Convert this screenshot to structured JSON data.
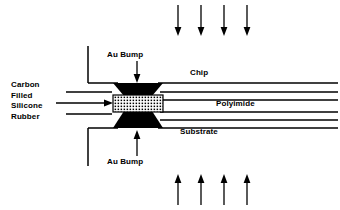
{
  "figure": {
    "background_color": "#ffffff",
    "line_color": "#000000",
    "fill_color": "#000000"
  },
  "labels": {
    "carbon_filled_silicone_rubber": "Carbon\nFilled\nSilicone\nRubber",
    "carbon_line_1": "Carbon",
    "carbon_line_2": "Filled",
    "carbon_line_3": "Silicone",
    "carbon_line_4": "Rubber",
    "au_bump_top": "Au Bump",
    "au_bump_bottom": "Au Bump",
    "chip": "Chip",
    "polyimide": "Polyimide",
    "substrate": "Substrate"
  },
  "force_arrows": {
    "top": {
      "count": 4,
      "direction": "down",
      "x_positions": [
        178,
        201,
        224,
        247
      ],
      "y_start": 5,
      "y_end": 35
    },
    "bottom": {
      "count": 4,
      "direction": "up",
      "x_positions": [
        178,
        201,
        224,
        247
      ],
      "y_start": 205,
      "y_end": 175
    }
  },
  "pointer_arrows": {
    "au_bump_top": {
      "direction": "down",
      "x": 137,
      "y_start": 61,
      "y_end": 83
    },
    "au_bump_bottom": {
      "direction": "up",
      "x": 137,
      "y_start": 156,
      "y_end": 131
    },
    "carbon_rubber": {
      "direction": "right",
      "y": 103,
      "x_start": 56,
      "x_end": 113
    }
  },
  "structures": {
    "chip_edge": "L-shaped outline, vertical left edge with horizontal underside",
    "substrate_edge": "L-shaped outline, horizontal top with vertical left edge",
    "polyimide_lines": 4,
    "top_bump_shape": "trapezoid-wide-top",
    "bottom_bump_shape": "trapezoid-wide-bottom",
    "rubber_block_fill": "stippled-dot-grid"
  }
}
